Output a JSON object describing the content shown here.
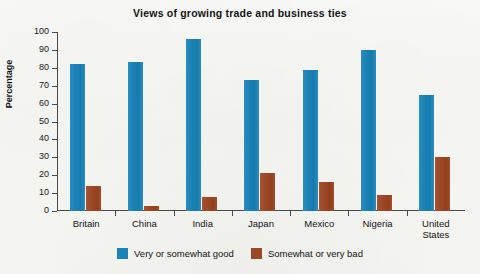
{
  "chart_data": {
    "type": "bar",
    "title": "Views of growing trade and business ties",
    "xlabel": "",
    "ylabel": "Percentage",
    "ylim": [
      0,
      100
    ],
    "ytick_step": 10,
    "yticks": [
      100,
      90,
      80,
      70,
      60,
      50,
      40,
      30,
      20,
      10,
      0
    ],
    "grid": false,
    "legend_position": "bottom-center",
    "categories": [
      "Britain",
      "China",
      "India",
      "Japan",
      "Mexico",
      "Nigeria",
      "United States"
    ],
    "series": [
      {
        "name": "Very or somewhat good",
        "color": "#1b82b5",
        "values": [
          82,
          83,
          96,
          73,
          79,
          90,
          65
        ]
      },
      {
        "name": "Somewhat or very bad",
        "color": "#9c4726",
        "values": [
          14,
          3,
          8,
          21,
          16,
          9,
          30
        ]
      }
    ]
  },
  "legend": {
    "items": [
      {
        "label": "Very or somewhat good",
        "swatch_name": "legend-swatch-good"
      },
      {
        "label": "Somewhat or very bad",
        "swatch_name": "legend-swatch-bad"
      }
    ]
  }
}
